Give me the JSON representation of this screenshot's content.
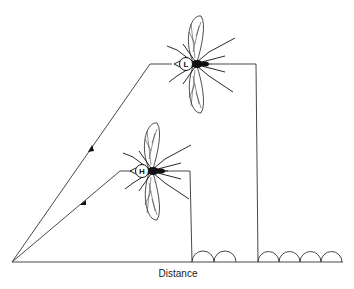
{
  "diagram": {
    "xlabel": "Distance",
    "mosquitoes": [
      {
        "id": "L",
        "label": "L",
        "description": "low-flying path mosquito at higher altitude"
      },
      {
        "id": "H",
        "label": "H",
        "description": "mosquito on lower path"
      }
    ],
    "paths": [
      {
        "name": "upper-path",
        "to_mosquito": "L",
        "arches_after_landing": 4
      },
      {
        "name": "lower-path",
        "to_mosquito": "H",
        "arches_after_landing": 2
      }
    ],
    "colors": {
      "line": "#333333",
      "background": "#ffffff"
    }
  }
}
